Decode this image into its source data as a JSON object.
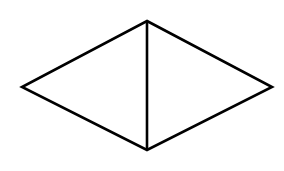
{
  "figure": {
    "name": "rhombus-with-vertical-diagonal",
    "background_color": "#ffffff",
    "stroke_color": "#000000",
    "stroke_width": 2.6,
    "canvas": {
      "width": 284,
      "height": 171
    },
    "vertices": {
      "top": {
        "label": "top-vertex",
        "x": 147,
        "y": 21
      },
      "left": {
        "label": "left-vertex",
        "x": 22,
        "y": 87
      },
      "right": {
        "label": "right-vertex",
        "x": 272,
        "y": 87
      },
      "bottom": {
        "label": "bottom-vertex",
        "x": 147,
        "y": 150
      }
    },
    "edges": [
      {
        "name": "upper-left-edge",
        "from": "left",
        "to": "top"
      },
      {
        "name": "upper-right-edge",
        "from": "top",
        "to": "right"
      },
      {
        "name": "lower-right-edge",
        "from": "right",
        "to": "bottom"
      },
      {
        "name": "lower-left-edge",
        "from": "bottom",
        "to": "left"
      }
    ],
    "diagonals": [
      {
        "name": "vertical-diagonal",
        "from": "top",
        "to": "bottom"
      }
    ],
    "outline_points": "147,21 272,87 147,150 22,87"
  }
}
